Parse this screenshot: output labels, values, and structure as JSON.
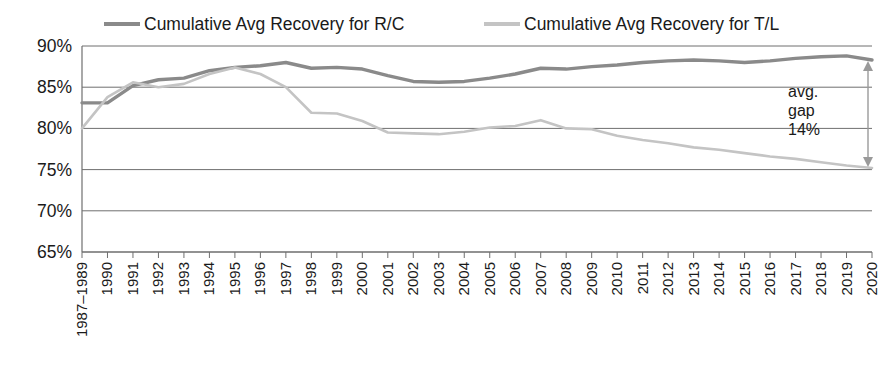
{
  "chart_data": {
    "type": "line",
    "title": "",
    "subtitle": "",
    "xlabel": "",
    "ylabel": "",
    "ylim": [
      65,
      90
    ],
    "ytick_labels": [
      "90%",
      "85%",
      "80%",
      "75%",
      "70%",
      "65%"
    ],
    "ytick_values": [
      90,
      85,
      80,
      75,
      70,
      65
    ],
    "grid": true,
    "legend_position": "top",
    "categories": [
      "1987–1989",
      "1990",
      "1991",
      "1992",
      "1993",
      "1994",
      "1995",
      "1996",
      "1997",
      "1998",
      "1999",
      "2000",
      "2001",
      "2002",
      "2003",
      "2004",
      "2005",
      "2006",
      "2007",
      "2008",
      "2009",
      "2010",
      "2011",
      "2012",
      "2013",
      "2014",
      "2015",
      "2016",
      "2017",
      "2018",
      "2019",
      "2020"
    ],
    "series": [
      {
        "name": "Cumulative Avg Recovery for R/C",
        "color": "#8a8a8a",
        "values": [
          83.1,
          83.1,
          85.2,
          85.9,
          86.1,
          87.0,
          87.4,
          87.6,
          88.0,
          87.3,
          87.4,
          87.2,
          86.4,
          85.7,
          85.6,
          85.7,
          86.1,
          86.6,
          87.3,
          87.2,
          87.5,
          87.7,
          88.0,
          88.2,
          88.3,
          88.2,
          88.0,
          88.2,
          88.5,
          88.7,
          88.8,
          88.3
        ]
      },
      {
        "name": "Cumulative Avg Recovery for T/L",
        "color": "#c4c4c4",
        "values": [
          80.0,
          83.8,
          85.6,
          85.0,
          85.4,
          86.6,
          87.4,
          86.6,
          85.0,
          81.9,
          81.8,
          80.9,
          79.5,
          79.4,
          79.3,
          79.6,
          80.1,
          80.3,
          81.0,
          80.0,
          79.9,
          79.1,
          78.6,
          78.2,
          77.7,
          77.4,
          77.0,
          76.6,
          76.3,
          75.9,
          75.5,
          75.2
        ]
      }
    ],
    "annotations": [
      {
        "name": "avg-gap-annotation",
        "lines": [
          "avg.",
          "gap",
          "14%"
        ],
        "text": "avg. gap 14%",
        "arrow": "double-headed-vertical",
        "at_category": "2020",
        "from_value": 88.3,
        "to_value": 75.2
      }
    ]
  },
  "legend": {
    "items": [
      {
        "label": "Cumulative Avg Recovery for R/C",
        "swatch_color": "#8a8a8a"
      },
      {
        "label": "Cumulative Avg Recovery for T/L",
        "swatch_color": "#c4c4c4"
      }
    ]
  },
  "colors": {
    "axis": "#6f6f6f",
    "grid": "#6f6f6f",
    "text": "#1a1a1a",
    "background": "#ffffff",
    "arrow": "#9a9a9a"
  }
}
